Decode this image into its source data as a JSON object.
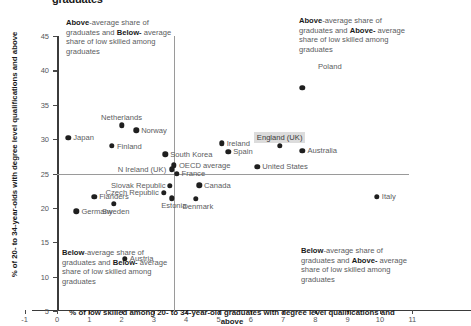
{
  "title": "graduates",
  "axes": {
    "x_title": "% of low skilled among 20- to 34-year-old graduates with degree level qualifications and above",
    "y_title": "% of 20- to 34-year-olds with degree level qualifications and above"
  },
  "quadrants": {
    "top_left": {
      "l1a": "Above",
      "l1b": "-average share of",
      "l2a": "graduates and ",
      "l2b": "Below-",
      "l3": "average share of low",
      "l4": "skilled among graduates"
    },
    "top_right": {
      "l1a": "Above",
      "l1b": "-average share of",
      "l2a": "graduates and ",
      "l2b": "Above-",
      "l3": "average share of low",
      "l4": "skilled among graduates"
    },
    "bottom_left": {
      "l1a": "Below",
      "l1b": "-average share of",
      "l2a": "graduates and ",
      "l2b": "Below-",
      "l3": "average share of low",
      "l4": "skilled among graduates"
    },
    "bottom_right": {
      "l1a": "Below",
      "l1b": "-average share of",
      "l2a": "graduates and ",
      "l2b": "Above-",
      "l3": "average share of low",
      "l4": "skilled among graduates"
    }
  },
  "chart_data": {
    "type": "scatter",
    "title": "graduates",
    "xlabel": "% of low skilled among 20- to 34-year-old graduates with degree level qualifications and above",
    "ylabel": "% of 20- to 34-year-olds with degree level qualifications and above",
    "xlim": [
      -1.2,
      11.4
    ],
    "ylim": [
      4.2,
      46.5
    ],
    "xticks": [
      -1,
      0,
      1,
      2,
      3,
      4,
      5,
      6,
      7,
      8,
      9,
      10,
      11
    ],
    "yticks": [
      5,
      10,
      15,
      20,
      25,
      30,
      35,
      40,
      45
    ],
    "grid": false,
    "legend": "none",
    "reference_lines": [
      {
        "axis": "x",
        "value": 3.62,
        "label": "average low skilled share"
      },
      {
        "axis": "y",
        "value": 25.0,
        "label": "average graduate share"
      }
    ],
    "highlighted_point": "England (UK)",
    "points": [
      {
        "name": "Poland",
        "x": 7.6,
        "y": 37.5,
        "label_pos": "legend"
      },
      {
        "name": "Netherlands",
        "x": 2.0,
        "y": 32.0,
        "label_pos": "above"
      },
      {
        "name": "Norway",
        "x": 2.45,
        "y": 31.3,
        "label_pos": "right"
      },
      {
        "name": "Japan",
        "x": 0.35,
        "y": 30.2,
        "label_pos": "right"
      },
      {
        "name": "Finland",
        "x": 1.7,
        "y": 29.0,
        "label_pos": "right"
      },
      {
        "name": "Ireland",
        "x": 5.1,
        "y": 29.4,
        "label_pos": "right"
      },
      {
        "name": "England (UK)",
        "x": 6.9,
        "y": 29.0,
        "label_pos": "above"
      },
      {
        "name": "Spain",
        "x": 5.3,
        "y": 28.2,
        "label_pos": "right"
      },
      {
        "name": "Australia",
        "x": 7.6,
        "y": 28.3,
        "label_pos": "right"
      },
      {
        "name": "South Korea",
        "x": 3.35,
        "y": 27.8,
        "label_pos": "right"
      },
      {
        "name": "OECD average",
        "x": 3.62,
        "y": 26.2,
        "label_pos": "right"
      },
      {
        "name": "N Ireland (UK)",
        "x": 3.55,
        "y": 25.6,
        "label_pos": "left"
      },
      {
        "name": "United States",
        "x": 6.2,
        "y": 26.0,
        "label_pos": "right"
      },
      {
        "name": "France",
        "x": 3.7,
        "y": 25.0,
        "label_pos": "right"
      },
      {
        "name": "Slovak Republic",
        "x": 3.5,
        "y": 23.2,
        "label_pos": "left"
      },
      {
        "name": "Canada",
        "x": 4.4,
        "y": 23.3,
        "label_pos": "right"
      },
      {
        "name": "Czech Republic",
        "x": 3.3,
        "y": 22.2,
        "label_pos": "left"
      },
      {
        "name": "Estonia",
        "x": 3.55,
        "y": 21.4,
        "label_pos": "below"
      },
      {
        "name": "Denmark",
        "x": 4.3,
        "y": 21.3,
        "label_pos": "below"
      },
      {
        "name": "Flanders",
        "x": 1.15,
        "y": 21.6,
        "label_pos": "right"
      },
      {
        "name": "Sweden",
        "x": 1.75,
        "y": 20.6,
        "label_pos": "below"
      },
      {
        "name": "Germany",
        "x": 0.6,
        "y": 19.5,
        "label_pos": "right"
      },
      {
        "name": "Italy",
        "x": 9.9,
        "y": 21.6,
        "label_pos": "right"
      },
      {
        "name": "Austria",
        "x": 2.1,
        "y": 12.6,
        "label_pos": "right"
      }
    ]
  }
}
